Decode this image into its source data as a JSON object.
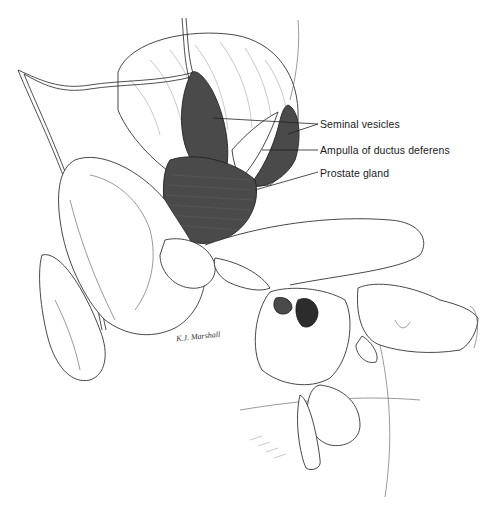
{
  "figure": {
    "type": "anatomical-illustration",
    "labels": [
      {
        "id": "seminal-vesicles",
        "text": "Seminal vesicles"
      },
      {
        "id": "ampulla",
        "text": "Ampulla of ductus deferens"
      },
      {
        "id": "prostate",
        "text": "Prostate gland"
      }
    ],
    "signature": "K.J. Marshall",
    "colors": {
      "gland_fill": "#4a4a4a",
      "line": "#222222",
      "background": "#ffffff"
    }
  }
}
